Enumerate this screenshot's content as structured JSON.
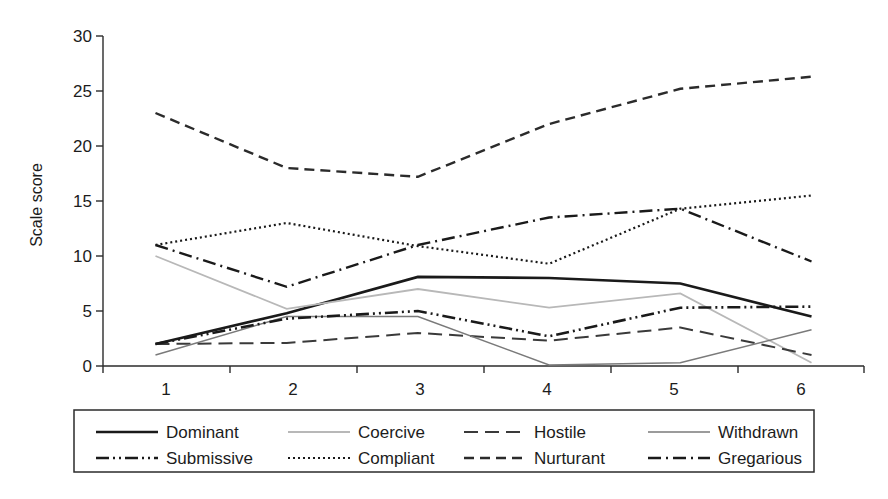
{
  "chart_data": {
    "type": "line",
    "title": "",
    "subtitle": "",
    "xlabel": "",
    "ylabel": "Scale score",
    "x": [
      1,
      2,
      3,
      4,
      5,
      6
    ],
    "xtick_labels": [
      "1",
      "2",
      "3",
      "4",
      "5",
      "6"
    ],
    "ytick_labels": [
      "0",
      "5",
      "10",
      "15",
      "20",
      "25",
      "30"
    ],
    "yticks": [
      0,
      5,
      10,
      15,
      20,
      25,
      30
    ],
    "xlim": [
      0.6,
      6.4
    ],
    "ylim": [
      0,
      30
    ],
    "grid": false,
    "legend_position": "bottom",
    "legend_columns": 4,
    "legend_rows": 2,
    "series": [
      {
        "name": "Dominant",
        "style": "solid",
        "color": "#1a1a1a",
        "width": 2.6,
        "dash": "none",
        "values": [
          2.0,
          4.8,
          8.1,
          8.0,
          7.5,
          4.5
        ]
      },
      {
        "name": "Coercive",
        "style": "solid",
        "color": "#b8b8b8",
        "width": 1.8,
        "dash": "none",
        "values": [
          10.0,
          5.2,
          7.0,
          5.3,
          6.6,
          0.3
        ]
      },
      {
        "name": "Hostile",
        "style": "long-dash",
        "color": "#3a3a3a",
        "width": 2.0,
        "dash": "14,7",
        "values": [
          2.0,
          2.1,
          3.0,
          2.3,
          3.5,
          1.0
        ]
      },
      {
        "name": "Withdrawn",
        "style": "solid",
        "color": "#7a7a7a",
        "width": 1.5,
        "dash": "none",
        "values": [
          1.0,
          4.5,
          4.5,
          0.1,
          0.3,
          3.3
        ]
      },
      {
        "name": "Submissive",
        "style": "dash-dot-dot",
        "color": "#1a1a1a",
        "width": 2.6,
        "dash": "13,4,2,4,2,4",
        "values": [
          2.0,
          4.3,
          5.0,
          2.7,
          5.3,
          5.4
        ]
      },
      {
        "name": "Compliant",
        "style": "dotted",
        "color": "#1a1a1a",
        "width": 2.2,
        "dash": "2,3",
        "values": [
          11.0,
          13.0,
          10.9,
          9.3,
          14.3,
          15.5
        ]
      },
      {
        "name": "Nurturant",
        "style": "dashed",
        "color": "#2b2b2b",
        "width": 2.4,
        "dash": "10,6",
        "values": [
          23.0,
          18.0,
          17.2,
          22.0,
          25.2,
          26.3
        ]
      },
      {
        "name": "Gregarious",
        "style": "dash-dot",
        "color": "#1a1a1a",
        "width": 2.4,
        "dash": "13,5,2,5",
        "values": [
          11.0,
          7.2,
          11.0,
          13.5,
          14.3,
          9.5
        ]
      }
    ]
  },
  "legend": {
    "items": [
      {
        "label": "Dominant"
      },
      {
        "label": "Coercive"
      },
      {
        "label": "Hostile"
      },
      {
        "label": "Withdrawn"
      },
      {
        "label": "Submissive"
      },
      {
        "label": "Compliant"
      },
      {
        "label": "Nurturant"
      },
      {
        "label": "Gregarious"
      }
    ]
  }
}
